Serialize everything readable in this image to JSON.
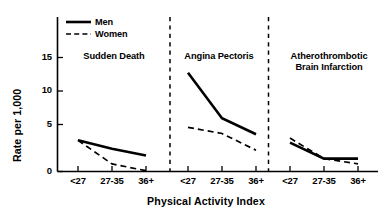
{
  "chart_data": {
    "type": "line",
    "title": "",
    "xlabel": "Physical Activity Index",
    "ylabel": "Rate per 1,000",
    "categories": [
      "<27",
      "27-35",
      "36+"
    ],
    "ylim": [
      0,
      17
    ],
    "yticks": [
      0,
      5,
      10,
      15
    ],
    "ytick_labels": [
      "0",
      "5",
      "10",
      "15"
    ],
    "grid": false,
    "legend_position": "top-left",
    "legend": [
      {
        "name": "Men",
        "style": "solid"
      },
      {
        "name": "Women",
        "style": "dashed"
      }
    ],
    "panels": [
      {
        "title": "Sudden Death",
        "series": [
          {
            "name": "Men",
            "style": "solid",
            "values": [
              4.1,
              3.0,
              2.1
            ]
          },
          {
            "name": "Women",
            "style": "dashed",
            "values": [
              4.1,
              1.0,
              0.1
            ]
          }
        ]
      },
      {
        "title": "Angina Pectoris",
        "series": [
          {
            "name": "Men",
            "style": "solid",
            "values": [
              13.0,
              7.0,
              4.9
            ]
          },
          {
            "name": "Women",
            "style": "dashed",
            "values": [
              5.8,
              5.0,
              2.8
            ]
          }
        ]
      },
      {
        "title": "Atherothrombotic\nBrain Infarction",
        "title_line1": "Atherothrombotic",
        "title_line2": "Brain Infarction",
        "series": [
          {
            "name": "Men",
            "style": "solid",
            "values": [
              3.8,
              1.7,
              1.7
            ]
          },
          {
            "name": "Women",
            "style": "dashed",
            "values": [
              4.4,
              1.7,
              1.0
            ]
          }
        ]
      }
    ]
  },
  "axis": {
    "y_label": "Rate per 1,000",
    "x_label": "Physical Activity Index",
    "y_ticks": [
      "15",
      "10",
      "5",
      "0"
    ],
    "x_ticks_panel1": [
      "<27",
      "27-35",
      "36+"
    ],
    "x_ticks_panel2": [
      "<27",
      "27-35",
      "36+"
    ],
    "x_ticks_panel3": [
      "<27",
      "27-35",
      "36+"
    ]
  },
  "legend": {
    "men_label": "Men",
    "women_label": "Women"
  },
  "panel_titles": {
    "panel1": "Sudden Death",
    "panel2": "Angina Pectoris",
    "panel3_line1": "Atherothrombotic",
    "panel3_line2": "Brain Infarction"
  },
  "colors": {
    "ink": "#000000",
    "background": "#ffffff"
  }
}
